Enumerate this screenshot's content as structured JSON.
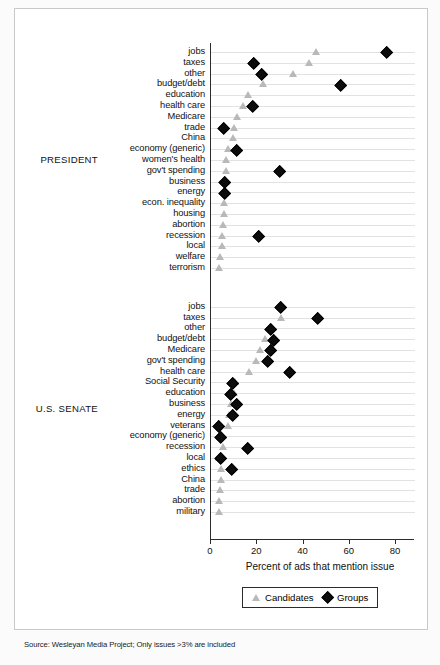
{
  "figure": {
    "source_note": "Source: Wesleyan Media Project; Only issues >3% are included",
    "xlabel": "Percent of ads that mention issue",
    "group_labels": {
      "president": "PRESIDENT",
      "senate": "U.S. SENATE"
    },
    "legend": {
      "candidates": "Candidates",
      "groups": "Groups"
    },
    "colors": {
      "candidates": "#b9b9b9",
      "groups": "#0c0c0c",
      "grid": "#e2e2e2",
      "axis": "#2b2b2b"
    }
  },
  "chart_data": {
    "type": "scatter",
    "title": "",
    "xlabel": "Percent of ads that mention issue",
    "ylabel": "",
    "xlim": [
      0,
      88
    ],
    "xticks": [
      0,
      20,
      40,
      60,
      80
    ],
    "xticklabels": [
      "0",
      "20",
      "40",
      "60",
      "80"
    ],
    "grid": true,
    "legend": [
      "Candidates",
      "Groups"
    ],
    "legend_position": "bottom-right",
    "panels": [
      {
        "name": "PRESIDENT",
        "categories": [
          "jobs",
          "taxes",
          "other",
          "budget/debt",
          "education",
          "health care",
          "Medicare",
          "trade",
          "China",
          "economy (generic)",
          "women's health",
          "gov't spending",
          "business",
          "energy",
          "econ. inequality",
          "housing",
          "abortion",
          "recession",
          "local",
          "welfare",
          "terrorism"
        ],
        "series": [
          {
            "name": "Candidates",
            "marker": "triangle",
            "values": [
              46,
              43,
              36,
              23,
              16.5,
              14.5,
              12,
              10.5,
              10,
              8,
              7,
              7,
              7,
              6.5,
              6.5,
              6.5,
              6,
              5.5,
              5.5,
              4.5,
              4
            ]
          },
          {
            "name": "Groups",
            "marker": "diamond",
            "values": [
              76,
              18.5,
              22,
              56,
              null,
              18,
              null,
              5.5,
              null,
              11,
              null,
              29.5,
              6,
              6,
              null,
              null,
              null,
              20.5,
              null,
              null,
              null
            ]
          }
        ]
      },
      {
        "name": "U.S. SENATE",
        "categories": [
          "jobs",
          "taxes",
          "other",
          "budget/debt",
          "Medicare",
          "gov't spending",
          "health care",
          "Social Security",
          "education",
          "business",
          "energy",
          "veterans",
          "economy (generic)",
          "recession",
          "local",
          "ethics",
          "China",
          "trade",
          "abortion",
          "military"
        ],
        "series": [
          {
            "name": "Candidates",
            "marker": "triangle",
            "values": [
              31,
              31,
              26,
              24,
              22,
              20,
              17,
              11,
              10.5,
              9.5,
              8.5,
              8,
              5.5,
              6,
              4,
              5,
              5,
              4.5,
              4,
              4
            ]
          },
          {
            "name": "Groups",
            "marker": "diamond",
            "values": [
              30,
              46,
              26,
              27,
              26,
              24.5,
              34,
              9.5,
              8.5,
              11,
              9.5,
              3.5,
              4,
              16,
              4,
              9,
              null,
              null,
              null,
              null
            ]
          }
        ]
      }
    ]
  }
}
